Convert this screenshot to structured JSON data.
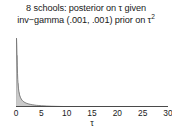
{
  "figure": {
    "title_line1": "8 schools:  posterior on τ given",
    "title_line2_a": "inv−gamma (.001, .001) prior on τ",
    "title_line2_sup": "2",
    "background_color": "#ffffff",
    "line_color": "#6e6e6e",
    "axis_color": "#4a4a4a",
    "text_color": "#1a1a1a"
  },
  "chart_data": {
    "type": "line",
    "xlabel": "τ",
    "ylabel": "",
    "xlim": [
      0,
      30
    ],
    "ylim": [
      0,
      1.0
    ],
    "grid": false,
    "legend": "none",
    "tick_labels": [
      "0",
      "5",
      "10",
      "15",
      "20",
      "25",
      "30"
    ],
    "tick_values": [
      0,
      5,
      10,
      15,
      20,
      25,
      30
    ],
    "series": [
      {
        "name": "posterior density of τ",
        "x": [
          0.0,
          0.05,
          0.1,
          0.15,
          0.2,
          0.25,
          0.3,
          0.35,
          0.4,
          0.5,
          0.6,
          0.7,
          0.8,
          0.9,
          1.0,
          1.2,
          1.4,
          1.6,
          1.8,
          2.0,
          2.4,
          2.8,
          3.2,
          3.6,
          4.0,
          4.5,
          5.0,
          6.0,
          7.0,
          8.0,
          9.0,
          10.0,
          12.0,
          14.0,
          16.0,
          18.0,
          20.0,
          22.0,
          24.0,
          26.0,
          28.0,
          30.0
        ],
        "y": [
          0.0,
          0.62,
          0.97,
          0.88,
          0.72,
          0.58,
          0.47,
          0.39,
          0.33,
          0.255,
          0.205,
          0.172,
          0.148,
          0.13,
          0.116,
          0.095,
          0.081,
          0.07,
          0.062,
          0.055,
          0.045,
          0.038,
          0.032,
          0.028,
          0.024,
          0.021,
          0.018,
          0.014,
          0.011,
          0.009,
          0.0075,
          0.0063,
          0.0046,
          0.0035,
          0.0028,
          0.0022,
          0.0018,
          0.0015,
          0.0012,
          0.001,
          0.0008,
          0.0007
        ]
      }
    ],
    "annotation": "Density spikes sharply near τ=0 then decays rapidly toward zero"
  }
}
